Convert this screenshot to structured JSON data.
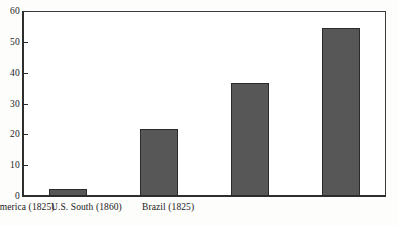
{
  "chart_data": {
    "type": "bar",
    "title": "",
    "subtitle": "",
    "xlabel": "",
    "ylabel": "",
    "categories": [
      "U.S. North (1860)",
      "Spanish America (1825)",
      "U.S. South (1860)",
      "Brazil (1825)"
    ],
    "values": [
      2.3,
      21.8,
      36.5,
      54.5
    ],
    "ylim": [
      0,
      60
    ],
    "ytick_labels": [
      "0",
      "10",
      "20",
      "30",
      "40",
      "50",
      "60"
    ],
    "ytick_values": [
      0,
      10,
      20,
      30,
      40,
      50,
      60
    ],
    "grid": false,
    "legend": null,
    "legend_position": "none",
    "bar_color": "#575757",
    "bar_edge_color": "#2b2b2b",
    "axis_color": "#2e2e2e",
    "background_color": "#ffffff",
    "annotations": []
  }
}
